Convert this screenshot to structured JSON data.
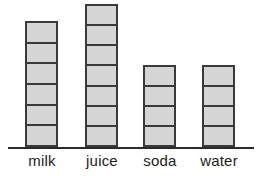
{
  "chart_data": {
    "type": "bar",
    "title": "",
    "subtitle": "",
    "xlabel": "",
    "ylabel": "",
    "categories": [
      "milk",
      "juice",
      "soda",
      "water"
    ],
    "values": [
      6,
      7,
      4,
      4
    ],
    "ylim": [
      0,
      7
    ],
    "grid": false,
    "legend": null,
    "annotations": []
  },
  "style": {
    "bar_fill": "#d6d6d6",
    "bar_outline": "#3a3a3a",
    "axis_color": "#2b2b2b",
    "label_color": "#1c1c1c",
    "background": "#ffffff"
  },
  "bars": [
    {
      "category": "milk",
      "segments": 6,
      "left_px": 25,
      "width_px": 33,
      "height_px": 126,
      "label": "milk",
      "label_left_px": 15,
      "label_width_px": 54
    },
    {
      "category": "juice",
      "segments": 7,
      "left_px": 85,
      "width_px": 33,
      "height_px": 143,
      "label": "juice",
      "label_left_px": 74,
      "label_width_px": 56
    },
    {
      "category": "soda",
      "segments": 4,
      "left_px": 143,
      "width_px": 33,
      "height_px": 82,
      "label": "soda",
      "label_left_px": 132,
      "label_width_px": 56
    },
    {
      "category": "water",
      "segments": 4,
      "left_px": 202,
      "width_px": 33,
      "height_px": 82,
      "label": "water",
      "label_left_px": 190,
      "label_width_px": 58
    }
  ]
}
